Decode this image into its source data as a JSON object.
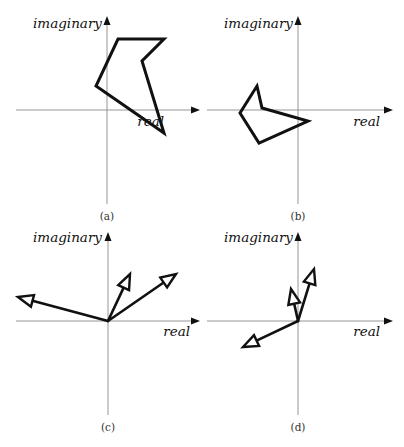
{
  "figure": {
    "panels": [
      {
        "id": "a",
        "caption": "(a)",
        "x_label": "real",
        "y_label": "imaginary",
        "kind": "polygon",
        "origin": [
          107,
          110
        ],
        "x_axis": [
          16,
          200
        ],
        "y_axis": [
          204,
          16
        ],
        "x_label_pos": [
          164,
          126
        ],
        "y_label_pos": [
          102,
          28
        ],
        "caption_pos": [
          107,
          220
        ],
        "polygon": [
          [
            118,
            39
          ],
          [
            164,
            39
          ],
          [
            142,
            61
          ],
          [
            164,
            133
          ],
          [
            96,
            86
          ]
        ]
      },
      {
        "id": "b",
        "caption": "(b)",
        "x_label": "real",
        "y_label": "imaginary",
        "kind": "polygon",
        "origin": [
          298,
          110
        ],
        "x_axis": [
          207,
          393
        ],
        "y_axis": [
          204,
          16
        ],
        "x_label_pos": [
          380,
          126
        ],
        "y_label_pos": [
          293,
          28
        ],
        "caption_pos": [
          298,
          220
        ],
        "polygon": [
          [
            257,
            86
          ],
          [
            262,
            108
          ],
          [
            308,
            121
          ],
          [
            259,
            143
          ],
          [
            240,
            113
          ]
        ]
      },
      {
        "id": "c",
        "caption": "(c)",
        "x_label": "real",
        "y_label": "imaginary",
        "kind": "vectors",
        "origin": [
          108,
          321
        ],
        "x_axis": [
          16,
          200
        ],
        "y_axis": [
          415,
          232
        ],
        "x_label_pos": [
          190,
          336
        ],
        "y_label_pos": [
          102,
          242
        ],
        "caption_pos": [
          108,
          431
        ],
        "vectors": [
          [
            18,
            297
          ],
          [
            130,
            274
          ],
          [
            176,
            274
          ]
        ]
      },
      {
        "id": "d",
        "caption": "(d)",
        "x_label": "real",
        "y_label": "imaginary",
        "kind": "vectors",
        "origin": [
          298,
          321
        ],
        "x_axis": [
          207,
          393
        ],
        "y_axis": [
          415,
          232
        ],
        "x_label_pos": [
          380,
          336
        ],
        "y_label_pos": [
          293,
          242
        ],
        "caption_pos": [
          298,
          431
        ],
        "vectors": [
          [
            243,
            347
          ],
          [
            291,
            289
          ],
          [
            314,
            269
          ]
        ]
      }
    ],
    "colors": {
      "stroke": "#111111",
      "axis": "#8a8a8a",
      "caption": "#333333"
    }
  }
}
